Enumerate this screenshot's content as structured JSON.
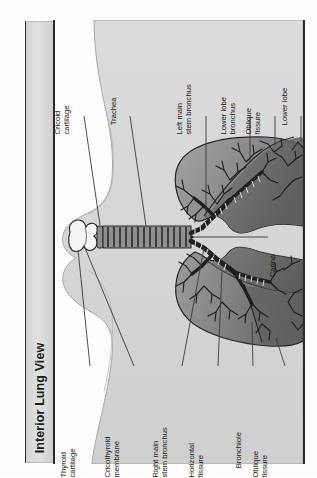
{
  "figure": {
    "title": "Interior Lung View",
    "type": "anatomical-illustration",
    "orientation": "page rotated 90 degrees counter-clockwise",
    "colors": {
      "page_background": "#fdfdfd",
      "title_bar": "#dcdcdc",
      "frame_rule": "#2a2a2a",
      "torso_silhouette": "#d6d6d6",
      "lung_fill_light": "#9a9a9a",
      "lung_fill_dark": "#6f6f6f",
      "airway_outline": "#2b2b2b",
      "larynx_fill": "#f2f2f2",
      "leader_line": "#3a3a3a"
    }
  },
  "labels": {
    "top": [
      {
        "id": "cricoid-cartilage",
        "lines": [
          "Cricoid",
          "cartilage"
        ]
      },
      {
        "id": "trachea",
        "lines": [
          "Trachea"
        ]
      },
      {
        "id": "left-main-stem-bronchus",
        "lines": [
          "Left main",
          "stem bronchus"
        ]
      },
      {
        "id": "lower-lobe-bronchus",
        "lines": [
          "Lower lobe",
          "bronchus"
        ]
      },
      {
        "id": "oblique-fissure-top",
        "lines": [
          "Oblique",
          "fissure"
        ]
      },
      {
        "id": "lower-lobe-top",
        "lines": [
          "Lower lobe"
        ]
      }
    ],
    "bottom": [
      {
        "id": "thyroid-cartilage",
        "lines": [
          "Thyroid",
          "cartilage"
        ]
      },
      {
        "id": "cricothyroid-membrane",
        "lines": [
          "Cricothyroid",
          "membrane"
        ]
      },
      {
        "id": "right-main-stem-bronchus",
        "lines": [
          "Right main",
          "stem bronchus"
        ]
      },
      {
        "id": "horizontal-fissure",
        "lines": [
          "Horizontal",
          "fissure"
        ]
      },
      {
        "id": "bronchiole",
        "lines": [
          "Bronchiole"
        ]
      },
      {
        "id": "oblique-fissure-bottom",
        "lines": [
          "Oblique",
          "fissure"
        ]
      }
    ],
    "side": [
      {
        "id": "carina",
        "lines": [
          "Carina"
        ]
      }
    ]
  }
}
